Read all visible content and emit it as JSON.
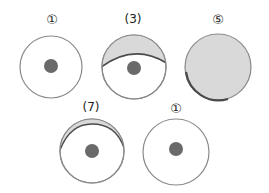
{
  "diagram": {
    "type": "lunar-phase-style eye diagrams",
    "colors": {
      "background": "#ffffff",
      "outline": "#8a8a8a",
      "pupil": "#6a6a6a",
      "shade": "#d9d9d9",
      "shade_edge": "#4a4a4a",
      "label": "#222222"
    },
    "figures": [
      {
        "id": "fig-1a",
        "label": "①",
        "label_style": "circled",
        "shading": "none",
        "pupil": true
      },
      {
        "id": "fig-3",
        "label": "(3)",
        "label_style": "parenthesized",
        "shading": "upper-crescent-large",
        "pupil": true
      },
      {
        "id": "fig-5",
        "label": "⑤",
        "label_style": "circled",
        "shading": "full",
        "pupil": false
      },
      {
        "id": "fig-7",
        "label": "(7)",
        "label_style": "parenthesized",
        "shading": "upper-crescent-thin",
        "pupil": true
      },
      {
        "id": "fig-1b",
        "label": "①",
        "label_style": "circled",
        "shading": "none",
        "pupil": true
      }
    ]
  }
}
